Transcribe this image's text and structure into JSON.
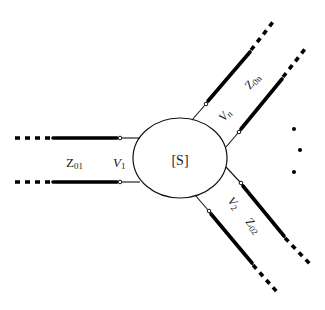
{
  "diagram": {
    "network": {
      "label": "[S]"
    },
    "ports": [
      {
        "id": "port-1",
        "voltage_label": "V",
        "voltage_sub": "1",
        "impedance_label": "Z",
        "impedance_sub": "01"
      },
      {
        "id": "port-2",
        "voltage_label": "V",
        "voltage_sub": "2",
        "impedance_label": "Z",
        "impedance_sub": "02"
      },
      {
        "id": "port-n",
        "voltage_label": "V",
        "voltage_sub": "n",
        "impedance_label": "Z",
        "impedance_sub": "0n"
      }
    ],
    "ellipsis": "..."
  }
}
